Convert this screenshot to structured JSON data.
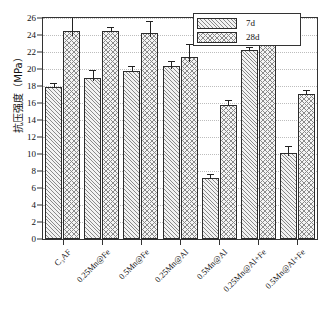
{
  "chart_data": {
    "type": "bar",
    "title": "",
    "xlabel": "",
    "ylabel": "抗压强度（MPa）",
    "ylim": [
      0,
      26
    ],
    "ytick_step": 2,
    "grid": true,
    "legend_position": "top-right",
    "categories": [
      "C₃AF",
      "0.25Mn@Fe",
      "0.5Mn@Fe",
      "0.25Mn@Al",
      "0.5Mn@Al",
      "0.25Mn@Al+Fe",
      "0.5Mn@Al+Fe"
    ],
    "series": [
      {
        "name": "7d",
        "values": [
          17.9,
          18.9,
          19.8,
          20.3,
          7.2,
          22.2,
          10.1
        ],
        "errors": [
          0.5,
          1.0,
          0.6,
          0.7,
          0.5,
          0.4,
          0.8
        ]
      },
      {
        "name": "28d",
        "values": [
          24.5,
          24.5,
          24.2,
          21.4,
          15.8,
          25.1,
          17.1
        ],
        "errors": [
          1.6,
          0.5,
          1.4,
          1.5,
          0.6,
          0.6,
          0.4
        ]
      }
    ],
    "ytick_labels": [
      "0",
      "2",
      "4",
      "6",
      "8",
      "10",
      "12",
      "14",
      "16",
      "18",
      "20",
      "22",
      "24",
      "26"
    ]
  },
  "legend": {
    "items": [
      {
        "label": "7d",
        "pattern": "diagonal-hatch"
      },
      {
        "label": "28d",
        "pattern": "cross-hatch"
      }
    ]
  },
  "axis": {
    "y_title": "抗压强度（MPa）"
  }
}
